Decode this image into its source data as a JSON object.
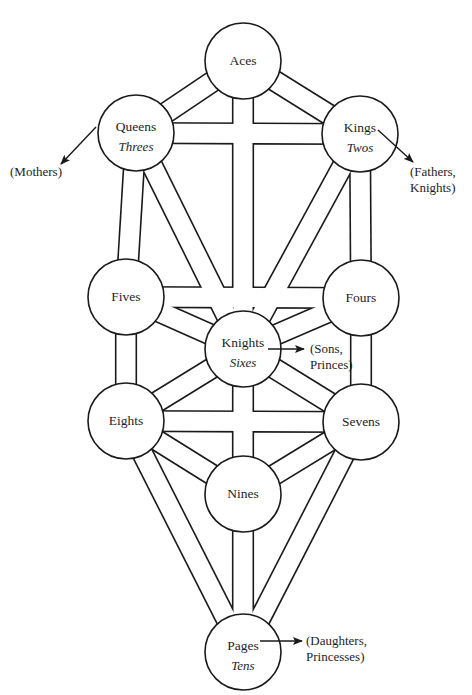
{
  "diagram": {
    "title": "",
    "colors": {
      "stroke": "#1a1a1a",
      "fill": "#ffffff",
      "text": "#1e1e1e"
    },
    "nodes": [
      {
        "id": "aces",
        "label": "Aces",
        "sub": "",
        "cx": 243,
        "cy": 61,
        "r": 38
      },
      {
        "id": "queens",
        "label": "Queens",
        "sub": "Threes",
        "cx": 136,
        "cy": 133,
        "r": 38
      },
      {
        "id": "kings",
        "label": "Kings",
        "sub": "Twos",
        "cx": 360,
        "cy": 134,
        "r": 38
      },
      {
        "id": "fives",
        "label": "Fives",
        "sub": "",
        "cx": 126,
        "cy": 297,
        "r": 38
      },
      {
        "id": "fours",
        "label": "Fours",
        "sub": "",
        "cx": 361,
        "cy": 298,
        "r": 38
      },
      {
        "id": "knights",
        "label": "Knights",
        "sub": "Sixes",
        "cx": 243,
        "cy": 349,
        "r": 38
      },
      {
        "id": "eights",
        "label": "Eights",
        "sub": "",
        "cx": 126,
        "cy": 421,
        "r": 38
      },
      {
        "id": "sevens",
        "label": "Sevens",
        "sub": "",
        "cx": 361,
        "cy": 422,
        "r": 38
      },
      {
        "id": "nines",
        "label": "Nines",
        "sub": "",
        "cx": 243,
        "cy": 494,
        "r": 38
      },
      {
        "id": "pages",
        "label": "Pages",
        "sub": "Tens",
        "cx": 243,
        "cy": 652,
        "r": 38
      }
    ],
    "paths": [
      [
        "aces",
        "queens"
      ],
      [
        "aces",
        "kings"
      ],
      [
        "aces",
        "knights"
      ],
      [
        "queens",
        "kings"
      ],
      [
        "queens",
        "fives"
      ],
      [
        "queens",
        "knights"
      ],
      [
        "kings",
        "fours"
      ],
      [
        "kings",
        "knights"
      ],
      [
        "fives",
        "fours"
      ],
      [
        "fives",
        "knights"
      ],
      [
        "fives",
        "eights"
      ],
      [
        "fours",
        "knights"
      ],
      [
        "fours",
        "sevens"
      ],
      [
        "knights",
        "eights"
      ],
      [
        "knights",
        "sevens"
      ],
      [
        "knights",
        "nines"
      ],
      [
        "eights",
        "sevens"
      ],
      [
        "eights",
        "nines"
      ],
      [
        "eights",
        "pages"
      ],
      [
        "sevens",
        "nines"
      ],
      [
        "sevens",
        "pages"
      ],
      [
        "nines",
        "pages"
      ]
    ],
    "annotations": [
      {
        "id": "mothers",
        "lines": [
          "(Mothers)"
        ],
        "from": "queens",
        "arrow": [
          96,
          127,
          61,
          164
        ],
        "text_x": 10,
        "text_y": 176
      },
      {
        "id": "fathers",
        "lines": [
          "(Fathers,",
          "Knights)"
        ],
        "from": "kings",
        "arrow": [
          378,
          130,
          413,
          162
        ],
        "text_x": 410,
        "text_y": 176
      },
      {
        "id": "sons",
        "lines": [
          "(Sons,",
          "Princes)"
        ],
        "from": "knights",
        "arrow": [
          268,
          349,
          304,
          349
        ],
        "text_x": 310,
        "text_y": 353
      },
      {
        "id": "daughters",
        "lines": [
          "(Daughters,",
          "Princesses)"
        ],
        "from": "pages",
        "arrow": [
          260,
          641,
          302,
          641
        ],
        "text_x": 306,
        "text_y": 645
      }
    ],
    "channel_width": 19,
    "line_width": 1.6
  }
}
